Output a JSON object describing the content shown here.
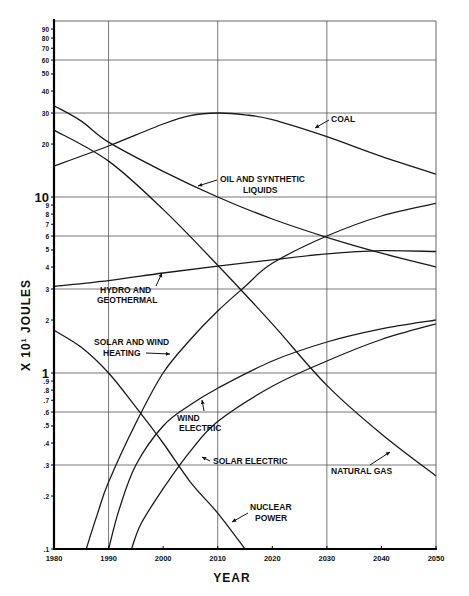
{
  "chart_data": {
    "type": "line",
    "title": "",
    "xlabel": "YEAR",
    "ylabel": "X 10¹ JOULES",
    "xscale": "linear",
    "yscale": "log",
    "xlim": [
      1980,
      2050
    ],
    "ylim": [
      0.1,
      100
    ],
    "grid": true,
    "legend": "inline labels",
    "x_ticks": [
      "1980",
      "1990",
      "2000",
      "2010",
      "2020",
      "2030",
      "2040",
      "2050"
    ],
    "x_grid": [
      1990,
      2010,
      2030
    ],
    "y_ticks": [
      {
        "v": 0.1,
        "t": ".1"
      },
      {
        "v": 0.2,
        "t": ".2"
      },
      {
        "v": 0.3,
        "t": ".3"
      },
      {
        "v": 0.4,
        "t": ".4"
      },
      {
        "v": 0.5,
        "t": ".5"
      },
      {
        "v": 0.6,
        "t": ".6"
      },
      {
        "v": 0.7,
        "t": ".7"
      },
      {
        "v": 0.8,
        "t": ".8"
      },
      {
        "v": 0.9,
        "t": ".9"
      },
      {
        "v": 1,
        "t": "1",
        "major": true
      },
      {
        "v": 2,
        "t": "2"
      },
      {
        "v": 3,
        "t": "3"
      },
      {
        "v": 4,
        "t": "4"
      },
      {
        "v": 5,
        "t": "5"
      },
      {
        "v": 6,
        "t": "6"
      },
      {
        "v": 7,
        "t": "7"
      },
      {
        "v": 8,
        "t": "8"
      },
      {
        "v": 9,
        "t": "9"
      },
      {
        "v": 10,
        "t": "10",
        "major": true
      },
      {
        "v": 20,
        "t": "20"
      },
      {
        "v": 30,
        "t": "30"
      },
      {
        "v": 40,
        "t": "40"
      },
      {
        "v": 50,
        "t": "50"
      },
      {
        "v": 60,
        "t": "60"
      },
      {
        "v": 70,
        "t": "70"
      },
      {
        "v": 80,
        "t": "80"
      },
      {
        "v": 90,
        "t": "90"
      }
    ],
    "y_grid": [
      0.3,
      0.6,
      1,
      3,
      6,
      10,
      30,
      60
    ],
    "series": [
      {
        "name": "COAL",
        "x": [
          1980,
          1990,
          2000,
          2005,
          2010,
          2015,
          2020,
          2030,
          2040,
          2050
        ],
        "values": [
          15,
          19.5,
          26,
          29,
          30,
          29.3,
          27.5,
          22,
          17,
          13.5
        ]
      },
      {
        "name": "OIL AND SYNTHETIC LIQUIDS",
        "x": [
          1980,
          1985,
          1990,
          2000,
          2010,
          2020,
          2030,
          2040,
          2050
        ],
        "values": [
          33,
          27,
          20.5,
          14,
          10,
          7.5,
          5.9,
          4.8,
          4.0
        ]
      },
      {
        "name": "NATURAL GAS",
        "x": [
          1980,
          1990,
          2000,
          2010,
          2020,
          2030,
          2040,
          2050
        ],
        "values": [
          24,
          16,
          8.5,
          4.1,
          1.9,
          0.85,
          0.45,
          0.26
        ]
      },
      {
        "name": "HYDRO AND GEOTHERMAL",
        "x": [
          1980,
          1990,
          2000,
          2010,
          2020,
          2030,
          2040,
          2050
        ],
        "values": [
          3.1,
          3.35,
          3.7,
          4.05,
          4.4,
          4.75,
          4.95,
          4.9
        ]
      },
      {
        "name": "SOLAR AND WIND HEATING",
        "x": [
          1985.9,
          1988,
          1990,
          1995,
          2000,
          2005,
          2010,
          2015,
          2020,
          2030,
          2040,
          2050
        ],
        "values": [
          0.1,
          0.16,
          0.24,
          0.52,
          1.0,
          1.55,
          2.25,
          3.1,
          4.2,
          6.0,
          7.8,
          9.2
        ]
      },
      {
        "name": "WIND ELECTRIC",
        "x": [
          1990,
          1992,
          1995,
          2000,
          2005,
          2010,
          2020,
          2030,
          2040,
          2050
        ],
        "values": [
          0.1,
          0.17,
          0.3,
          0.5,
          0.66,
          0.82,
          1.17,
          1.5,
          1.78,
          2.0
        ]
      },
      {
        "name": "SOLAR ELECTRIC",
        "x": [
          1994.2,
          1996,
          2000,
          2005,
          2010,
          2020,
          2030,
          2040,
          2050
        ],
        "values": [
          0.1,
          0.14,
          0.22,
          0.36,
          0.53,
          0.84,
          1.17,
          1.55,
          1.9
        ]
      },
      {
        "name": "NUCLEAR POWER",
        "x": [
          1980,
          1985,
          1990,
          1995,
          2000,
          2005,
          2010,
          2015
        ],
        "values": [
          1.75,
          1.4,
          1.0,
          0.64,
          0.4,
          0.24,
          0.16,
          0.1
        ]
      }
    ],
    "annotations": [
      {
        "id": "coal",
        "lines": [
          "COAL"
        ],
        "x": 331,
        "y": 122,
        "anchor": "start",
        "arrow": [
          329,
          120,
          315,
          128
        ]
      },
      {
        "id": "oil",
        "lines": [
          "OIL AND SYNTHETIC",
          "LIQUIDS"
        ],
        "x": 220,
        "y": 182,
        "x2": 243,
        "y2": 193,
        "anchor": "start",
        "arrow": [
          217,
          180,
          198,
          186
        ]
      },
      {
        "id": "hydro",
        "lines": [
          "HYDRO AND",
          "GEOTHERMAL"
        ],
        "x": 100,
        "y": 293,
        "x2": 97,
        "y2": 303,
        "anchor": "start",
        "arrow": [
          156,
          286,
          162,
          273
        ]
      },
      {
        "id": "solarwind",
        "lines": [
          "SOLAR AND WIND",
          "HEATING"
        ],
        "x": 94,
        "y": 345,
        "x2": 103,
        "y2": 356,
        "anchor": "start",
        "arrow": [
          146,
          353,
          170,
          354
        ]
      },
      {
        "id": "windelec",
        "lines": [
          "WIND",
          "ELECTRIC"
        ],
        "x": 177,
        "y": 421,
        "x2": 179,
        "y2": 431,
        "anchor": "start",
        "arrow": [
          204,
          411,
          202,
          400
        ]
      },
      {
        "id": "solarelec",
        "lines": [
          "SOLAR ELECTRIC"
        ],
        "x": 213,
        "y": 464,
        "anchor": "start",
        "arrow": [
          210,
          461,
          202,
          457
        ]
      },
      {
        "id": "natgas",
        "lines": [
          "NATURAL GAS"
        ],
        "x": 331,
        "y": 474,
        "anchor": "start",
        "arrow": [
          370,
          465,
          390,
          452
        ]
      },
      {
        "id": "nuclear",
        "lines": [
          "NUCLEAR",
          "POWER"
        ],
        "x": 250,
        "y": 510,
        "x2": 255,
        "y2": 521,
        "anchor": "start",
        "arrow": [
          248,
          513,
          232,
          522
        ]
      }
    ]
  },
  "layout": {
    "plot_left": 54,
    "plot_right": 436,
    "plot_top": 21,
    "plot_bottom": 549,
    "line_color": "#1a1a1a",
    "grid_color": "#555555"
  }
}
